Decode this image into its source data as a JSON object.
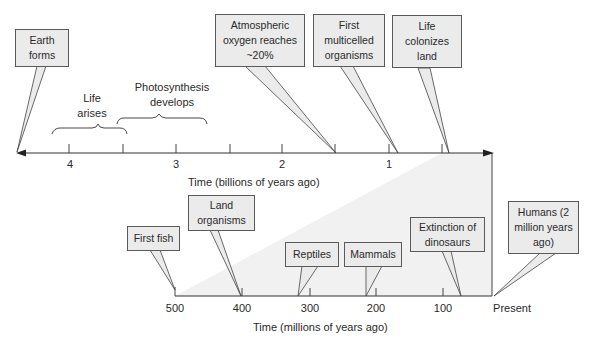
{
  "top_axis": {
    "title": "Time (billions of years ago)",
    "ticks": [
      "4",
      "3",
      "2",
      "1"
    ]
  },
  "bottom_axis": {
    "title": "Time (millions of years ago)",
    "ticks": [
      "500",
      "400",
      "300",
      "200",
      "100",
      "Present"
    ]
  },
  "top_events": [
    {
      "label": "Earth forms"
    },
    {
      "label": "Atmospheric oxygen reaches ~20%"
    },
    {
      "label": "First multicelled organisms"
    },
    {
      "label": "Life colonizes land"
    }
  ],
  "top_ranges": [
    {
      "label": "Life arises"
    },
    {
      "label": "Photosynthesis develops"
    }
  ],
  "bottom_events": [
    {
      "label": "First fish"
    },
    {
      "label": "Land organisms"
    },
    {
      "label": "Reptiles"
    },
    {
      "label": "Mammals"
    },
    {
      "label": "Extinction of dinosaurs"
    },
    {
      "label": "Humans (2 million years ago)"
    }
  ],
  "colors": {
    "box_fill": "#ebebeb",
    "shade": "#f0f0f0",
    "line": "#333333"
  }
}
